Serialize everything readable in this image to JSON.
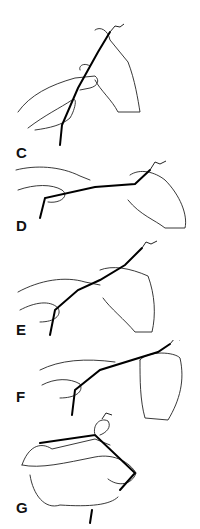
{
  "figure": {
    "panels": [
      {
        "label": "C"
      },
      {
        "label": "D"
      },
      {
        "label": "E"
      },
      {
        "label": "F"
      },
      {
        "label": "G"
      }
    ]
  }
}
